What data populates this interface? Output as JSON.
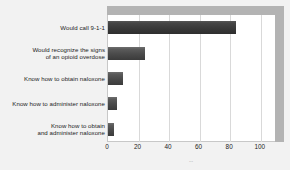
{
  "chart_data": {
    "type": "bar",
    "orientation": "horizontal",
    "title": "",
    "xlabel": "",
    "ylabel": "",
    "categories": [
      "Would call 9-1-1",
      "Would recognize the signs of an opioid overdose",
      "Know how to obtain naloxone",
      "Know how to administer naloxone",
      "Know how to obtain and administer naloxone"
    ],
    "category_lines": [
      [
        "Would call 9-1-1"
      ],
      [
        "Would recognize the signs",
        "of an opioid overdose"
      ],
      [
        "Know how to obtain naloxone"
      ],
      [
        "Know how to administer naloxone"
      ],
      [
        "Know how to obtain",
        "and administer naloxone"
      ]
    ],
    "values": [
      84,
      24,
      10,
      6,
      4
    ],
    "xlim": [
      0,
      110
    ],
    "xticks": [
      0,
      20,
      40,
      60,
      80,
      100
    ],
    "xticklabels": [
      "0",
      "20",
      "40",
      "60",
      "80",
      "100"
    ],
    "gridlines": [
      20,
      40,
      60,
      80,
      100
    ],
    "grid": true,
    "legend": null,
    "bar_color": "#4a4a4a",
    "plot_background": "#ffffff",
    "figure_background": "#f2f2f2",
    "wall_color": "#b3b3b3",
    "gridline_color": "#d9d9d9"
  },
  "axis_footer": "..."
}
